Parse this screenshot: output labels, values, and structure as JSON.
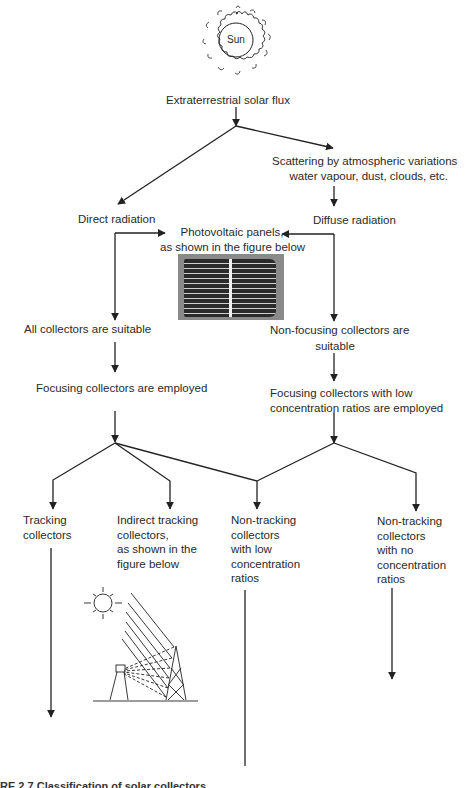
{
  "diagram": {
    "sun": {
      "label": "Sun",
      "icon": "sun-icon"
    },
    "nodes": {
      "extraterrestrial": "Extraterrestrial solar flux",
      "scattering_line1": "Scattering by atmospheric variations",
      "scattering_line2": "water vapour, dust, clouds, etc.",
      "direct": "Direct radiation",
      "diffuse": "Diffuse radiation",
      "pv_line1": "Photovoltaic panels,",
      "pv_line2": "as shown in the figure below",
      "all_suitable": "All collectors are suitable",
      "nonfocusing_line1": "Non-focusing collectors are",
      "nonfocusing_line2": "suitable",
      "focusing_employed": "Focusing collectors are employed",
      "focusing_low_line1": "Focusing collectors with low",
      "focusing_low_line2": "concentration ratios are employed",
      "tracking": "Tracking\ncollectors",
      "indirect_tracking": "Indirect tracking\ncollectors,\nas shown in the\nfigure below",
      "nontracking_low": "Non-tracking\ncollectors\nwith low\nconcentration\nratios",
      "nontracking_no": "Non-tracking\ncollectors\nwith no\nconcentration\nratios"
    },
    "images": {
      "pv_panel": "photovoltaic-panel-photo",
      "heliostat": "heliostat-tower-sketch"
    },
    "caption": "RE 2.7  Classification of solar collectors"
  },
  "colors": {
    "line": "#222222",
    "text": "#2a2a2a",
    "background": "#ffffff"
  }
}
